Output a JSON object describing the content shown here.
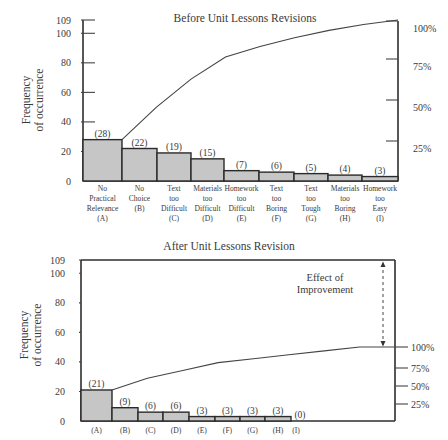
{
  "chart_data": [
    {
      "type": "bar",
      "subtype": "pareto",
      "title": "Before Unit Lessons Revisions",
      "xlabel": "",
      "ylabel": "Frequency of occurrence",
      "ylim": [
        0,
        109
      ],
      "yticks": [
        "0",
        "20",
        "40",
        "60",
        "80",
        "100",
        "109"
      ],
      "secondary_yticks": [
        "25%",
        "50%",
        "75%",
        "100%"
      ],
      "categories": [
        {
          "lines": [
            "No",
            "Practical",
            "Relevance",
            "(A)"
          ]
        },
        {
          "lines": [
            "No",
            "Choice",
            "(B)"
          ]
        },
        {
          "lines": [
            "Text",
            "too",
            "Difficult",
            "(C)"
          ]
        },
        {
          "lines": [
            "Materials",
            "too",
            "Difficult",
            "(D)"
          ]
        },
        {
          "lines": [
            "Homework",
            "too",
            "Difficult",
            "(E)"
          ]
        },
        {
          "lines": [
            "Text",
            "too",
            "Boring",
            "(F)"
          ]
        },
        {
          "lines": [
            "Text",
            "too",
            "Tough",
            "(G)"
          ]
        },
        {
          "lines": [
            "Materials",
            "too",
            "Boring",
            "(H)"
          ]
        },
        {
          "lines": [
            "Homework",
            "too",
            "Easy",
            "(I)"
          ]
        }
      ],
      "values": [
        28,
        22,
        19,
        15,
        7,
        6,
        5,
        4,
        3
      ],
      "value_labels": [
        "(28)",
        "(22)",
        "(19)",
        "(15)",
        "(7)",
        "(6)",
        "(5)",
        "(4)",
        "(3)"
      ],
      "cumulative": [
        28,
        50,
        69,
        84,
        91,
        97,
        102,
        106,
        109
      ],
      "grid": false,
      "legend": "none"
    },
    {
      "type": "bar",
      "subtype": "pareto",
      "title": "After Unit Lessons Revision",
      "xlabel": "",
      "ylabel": "Frequency of occurrence",
      "ylim": [
        0,
        109
      ],
      "yticks": [
        "0",
        "20",
        "40",
        "60",
        "80",
        "100",
        "109"
      ],
      "secondary_yticks": [
        "25%",
        "50%",
        "75%",
        "100%"
      ],
      "categories": [
        {
          "lines": [
            "(A)"
          ]
        },
        {
          "lines": [
            "(B)"
          ]
        },
        {
          "lines": [
            "(C)"
          ]
        },
        {
          "lines": [
            "(D)"
          ]
        },
        {
          "lines": [
            "(E)"
          ]
        },
        {
          "lines": [
            "(F)"
          ]
        },
        {
          "lines": [
            "(G)"
          ]
        },
        {
          "lines": [
            "(H)"
          ]
        },
        {
          "lines": [
            "(I)"
          ]
        }
      ],
      "values": [
        21,
        9,
        6,
        6,
        3,
        3,
        3,
        3,
        0
      ],
      "value_labels": [
        "(21)",
        "(9)",
        "(6)",
        "(6)",
        "(3)",
        "(3)",
        "(3)",
        "(3)",
        "(0)"
      ],
      "cumulative": [
        21,
        30,
        36,
        42,
        45,
        48,
        51,
        54,
        54
      ],
      "annotations": [
        "Effect of",
        "Improvement"
      ],
      "grid": false,
      "legend": "none"
    }
  ]
}
